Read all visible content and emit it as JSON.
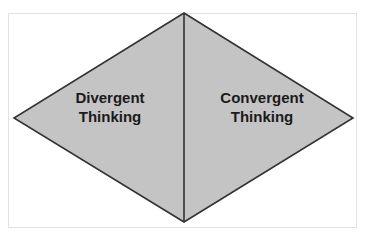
{
  "diagram": {
    "type": "diamond-split-two-halves",
    "background_color": "#ffffff",
    "frame": {
      "name": "outer-border-frame",
      "color": "#e2e2e2"
    },
    "shape": {
      "name": "diamond",
      "fill_color": "#c4c4c4",
      "stroke_color": "#333333",
      "stroke_width": 1.5,
      "vertices": {
        "top": [
          184,
          13
        ],
        "right": [
          353,
          118
        ],
        "bottom": [
          184,
          222
        ],
        "left": [
          14,
          118
        ]
      },
      "divider": {
        "name": "vertical-center-divider",
        "color": "#333333",
        "from": [
          184,
          13
        ],
        "to": [
          184,
          222
        ]
      }
    },
    "left_half": {
      "label_line1": "Divergent",
      "label_line2": "Thinking",
      "text_color": "#1b1b1b"
    },
    "right_half": {
      "label_line1": "Convergent",
      "label_line2": "Thinking",
      "text_color": "#1b1b1b"
    }
  }
}
